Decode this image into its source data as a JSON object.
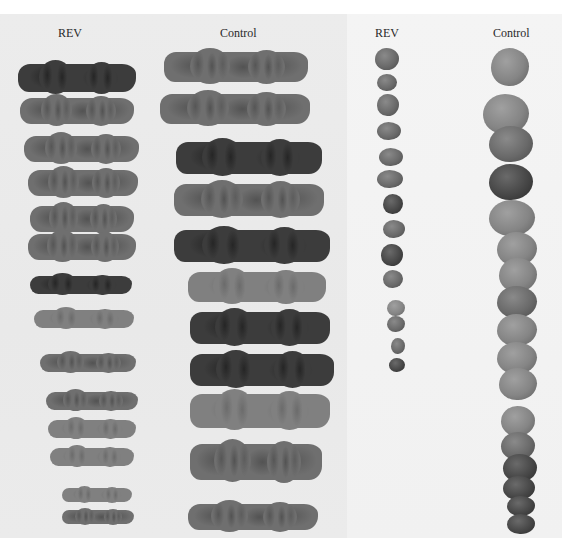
{
  "figure": {
    "left_panel": {
      "labels": [
        "REV",
        "Control"
      ],
      "rev_strip_count": 14,
      "control_strip_count": 12
    },
    "right_panel": {
      "labels": [
        "REV",
        "Control"
      ],
      "rev_nodule_count": 15,
      "control_nodule_count": 20
    },
    "colors": {
      "left_background": "#eaeaea",
      "right_background": "#f2f2f2",
      "specimen": "#6f6f6f",
      "label_text": "#2a2a2a"
    }
  }
}
